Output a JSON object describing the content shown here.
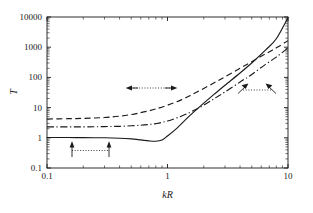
{
  "chart_data": {
    "type": "line",
    "title": "",
    "xlabel": "kR",
    "ylabel": "T",
    "xscale": "log",
    "yscale": "log",
    "xlim": [
      0.1,
      10
    ],
    "ylim": [
      0.1,
      10000
    ],
    "grid": false,
    "legend": "none",
    "frame": "box",
    "xticks": [
      0.1,
      1,
      10
    ],
    "xtick_labels": [
      "0.1",
      "1",
      "10"
    ],
    "yticks": [
      0.1,
      1,
      10,
      100,
      1000,
      10000
    ],
    "ytick_labels": [
      "0.1",
      "1",
      "10",
      "100",
      "1000",
      "10000"
    ],
    "minor_ticks": true,
    "series": [
      {
        "name": "solid",
        "style": "solid",
        "color": "#1a1a1a",
        "x": [
          0.1,
          0.15,
          0.2,
          0.3,
          0.4,
          0.5,
          0.6,
          0.7,
          0.8,
          0.9,
          1.0,
          1.2,
          1.5,
          2.0,
          2.5,
          3.0,
          4.0,
          5.0,
          6.5,
          8.0,
          10.0
        ],
        "y": [
          1.02,
          1.02,
          1.01,
          1.0,
          0.97,
          0.92,
          0.85,
          0.79,
          0.77,
          0.85,
          1.15,
          2.1,
          5.0,
          14.0,
          30.0,
          55.0,
          140.0,
          300.0,
          800.0,
          1900.0,
          9500.0
        ]
      },
      {
        "name": "dashed",
        "style": "dashed",
        "color": "#1a1a1a",
        "x": [
          0.1,
          0.15,
          0.2,
          0.3,
          0.4,
          0.5,
          0.6,
          0.7,
          0.8,
          1.0,
          1.3,
          1.6,
          2.0,
          2.5,
          3.0,
          4.0,
          5.0,
          6.5,
          8.0,
          10.0
        ],
        "y": [
          4.2,
          4.3,
          4.4,
          4.7,
          5.2,
          5.9,
          6.8,
          7.8,
          9.0,
          12.0,
          18.0,
          27.0,
          43.0,
          70.0,
          105.0,
          200.0,
          330.0,
          600.0,
          950.0,
          1650.0
        ]
      },
      {
        "name": "dash-dot",
        "style": "dashdot",
        "color": "#1a1a1a",
        "x": [
          0.1,
          0.2,
          0.3,
          0.4,
          0.5,
          0.6,
          0.7,
          0.8,
          1.0,
          1.3,
          1.6,
          2.0,
          2.5,
          3.0,
          4.0,
          5.0,
          6.5,
          8.0,
          10.0
        ],
        "y": [
          2.3,
          2.3,
          2.35,
          2.4,
          2.5,
          2.6,
          2.75,
          2.95,
          3.6,
          5.2,
          7.5,
          12.0,
          21.0,
          33.0,
          70.0,
          125.0,
          270.0,
          470.0,
          950.0
        ]
      }
    ],
    "annotations": [
      {
        "name": "lower-left-bracket",
        "kind": "double-arrow-vertical",
        "line_style": "dotted",
        "x_start": 0.16,
        "x_end": 0.33,
        "y": 0.28,
        "arrow_direction": "up"
      },
      {
        "name": "middle-bracket",
        "kind": "double-arrow-horizontal",
        "line_style": "dotted",
        "x_start": 0.52,
        "x_end": 1.08,
        "y": 42,
        "arrow_direction": "outward"
      },
      {
        "name": "right-bracket",
        "kind": "double-arrow-diagonal",
        "line_style": "dotted",
        "x_start": 4.0,
        "x_end": 8.0,
        "y": 38,
        "arrow_direction": "outward-diagonal"
      }
    ]
  }
}
